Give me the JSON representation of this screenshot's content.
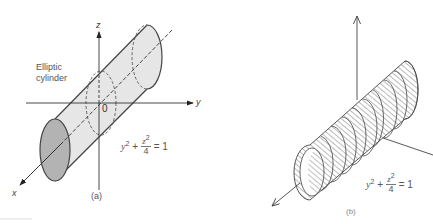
{
  "figure_a": {
    "caption": "(a)",
    "label_line1": "Elliptic",
    "label_line2": "cylinder",
    "axis_labels": {
      "z": "z",
      "y": "y",
      "x": "x"
    },
    "origin_label": "0",
    "equation": {
      "term1_base": "y",
      "term1_exp": "2",
      "plus": "+",
      "num_base": "z",
      "num_exp": "2",
      "den": "4",
      "equals": "= 1"
    },
    "colors": {
      "shell_fill": "#e6e6e6",
      "end_cap_fill": "#b3b3b3",
      "stroke": "#444444"
    }
  },
  "figure_b": {
    "caption": "(b)",
    "equation": {
      "term1_base": "y",
      "term1_exp": "2",
      "plus": "+",
      "num_base": "z",
      "num_exp": "2",
      "den": "4",
      "equals": "= 1"
    },
    "colors": {
      "hatch": "#555555",
      "stroke": "#444444"
    }
  }
}
